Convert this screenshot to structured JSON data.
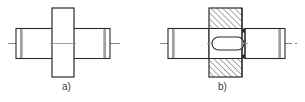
{
  "sheet": {
    "title": "Shaft with collar - external view and sectional view",
    "background_color": "#ffffff",
    "line_color": "#2b2b2b",
    "centerline_color": "#555555",
    "hatch_color": "#2b2b2b",
    "width": 305,
    "height": 102
  },
  "figures": [
    {
      "id": "figure-a",
      "caption": "a)",
      "kind": "external-view",
      "description": "Shaft with central rectangular collar shown as an outside view, no section hatching",
      "centerline_y": 43,
      "collar": {
        "x": 52,
        "y": 8,
        "width": 22,
        "height": 69,
        "hatched": false
      },
      "shaft_left": {
        "x": 16,
        "y": 28,
        "width": 36,
        "height": 30,
        "chamfer_x": 21
      },
      "shaft_right": {
        "x": 74,
        "y": 28,
        "width": 36,
        "height": 30,
        "chamfer_x": 105
      },
      "centerline": {
        "x1": 8,
        "x2": 120
      }
    },
    {
      "id": "figure-b",
      "caption": "b)",
      "kind": "sectional-view",
      "description": "Same shaft with collar shown in section; collar is cross hatched at 45 degrees, shaft through the collar is left unhatched with a stadium shaped slot outline",
      "centerline_y": 43,
      "collar": {
        "x": 209,
        "y": 8,
        "width": 33,
        "height": 69,
        "hatched": true,
        "hatch_angle_deg": 45,
        "hatch_spacing": 4
      },
      "shaft_left": {
        "x": 168,
        "y": 28,
        "width": 41,
        "height": 30,
        "chamfer_x": 173
      },
      "shaft_right": {
        "x": 245,
        "y": 28,
        "width": 40,
        "height": 30,
        "chamfer_x": 280
      },
      "slot": {
        "x": 212,
        "y": 37,
        "width": 32,
        "height": 13,
        "shape": "stadium",
        "hatched": false
      },
      "edge_detail": {
        "x": 242,
        "y": 28,
        "width": 3,
        "height": 30,
        "note": "narrow vertical band at right face of collar"
      },
      "centerline": {
        "x1": 160,
        "x2": 297
      }
    }
  ]
}
